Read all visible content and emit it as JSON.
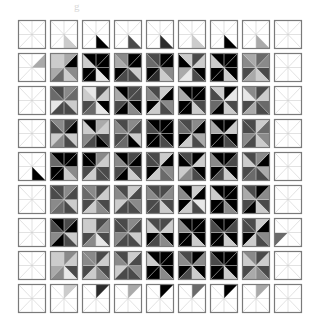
{
  "figure": {
    "type": "glyph-matrix",
    "title_artifact": "g",
    "rows": 9,
    "cols": 9,
    "cell_width_px": 32,
    "cell_height_px": 33,
    "grid_origin_x_px": 16,
    "grid_origin_y_px": 18,
    "background_color": "#ffffff",
    "border_color": "#7a7a7a",
    "guide_line_color": "#cfcfcf",
    "sector_count": 8,
    "sector_description": "Each cell is a square divided into 8 triangular sectors radiating from the center; each sector is filled with a grayscale level encoding a data value.",
    "palette": {
      "level_0": "#ffffff",
      "level_1": "#e8e8e8",
      "level_2": "#cccccc",
      "level_3": "#aaaaaa",
      "level_4": "#8a8a8a",
      "level_5": "#6a6a6a",
      "level_6": "#4a4a4a",
      "level_7": "#2b2b2b",
      "level_8": "#111111",
      "level_9": "#000000"
    }
  },
  "chart_data": {
    "type": "heatmap",
    "title": "",
    "subtitle": "",
    "xlabel": "",
    "ylabel": "",
    "grid": true,
    "legend": "none",
    "xticklabels": [
      "1",
      "2",
      "3",
      "4",
      "5",
      "6",
      "7",
      "8",
      "9"
    ],
    "yticklabels": [
      "1",
      "2",
      "3",
      "4",
      "5",
      "6",
      "7",
      "8",
      "9"
    ],
    "encoding": "Each matrix entry is drawn as an 8-sector pinwheel glyph; sector grayscale level (0 = white, 9 = black) is the datum.",
    "values": [
      [
        [
          0,
          0,
          0,
          0,
          0,
          0,
          0,
          0
        ],
        [
          0,
          0,
          0,
          0,
          2,
          0,
          0,
          0
        ],
        [
          0,
          0,
          0,
          0,
          9,
          0,
          0,
          0
        ],
        [
          0,
          0,
          0,
          0,
          6,
          0,
          0,
          0
        ],
        [
          0,
          0,
          0,
          0,
          7,
          0,
          0,
          0
        ],
        [
          0,
          0,
          0,
          0,
          2,
          0,
          0,
          0
        ],
        [
          0,
          0,
          0,
          0,
          9,
          0,
          0,
          0
        ],
        [
          0,
          0,
          0,
          0,
          3,
          0,
          0,
          0
        ],
        [
          0,
          0,
          0,
          0,
          0,
          0,
          0,
          0
        ]
      ],
      [
        [
          0,
          0,
          3,
          0,
          0,
          0,
          0,
          0
        ],
        [
          2,
          3,
          9,
          4,
          2,
          5,
          3,
          2
        ],
        [
          9,
          9,
          9,
          9,
          1,
          9,
          9,
          2
        ],
        [
          4,
          9,
          9,
          2,
          6,
          6,
          9,
          3
        ],
        [
          6,
          9,
          9,
          4,
          2,
          7,
          9,
          5
        ],
        [
          2,
          6,
          2,
          9,
          6,
          1,
          3,
          9
        ],
        [
          9,
          9,
          9,
          9,
          2,
          9,
          9,
          2
        ],
        [
          3,
          5,
          4,
          6,
          2,
          3,
          6,
          4
        ],
        [
          0,
          0,
          0,
          0,
          0,
          0,
          0,
          0
        ]
      ],
      [
        [
          0,
          0,
          0,
          0,
          0,
          0,
          0,
          0
        ],
        [
          6,
          4,
          5,
          2,
          6,
          6,
          1,
          5
        ],
        [
          1,
          6,
          2,
          9,
          1,
          5,
          6,
          2
        ],
        [
          9,
          6,
          6,
          9,
          4,
          9,
          6,
          3
        ],
        [
          6,
          2,
          9,
          4,
          6,
          2,
          9,
          4
        ],
        [
          9,
          9,
          9,
          6,
          2,
          9,
          9,
          3
        ],
        [
          2,
          9,
          1,
          6,
          2,
          9,
          5,
          6
        ],
        [
          4,
          6,
          2,
          5,
          6,
          3,
          6,
          1
        ],
        [
          0,
          0,
          0,
          0,
          0,
          0,
          0,
          0
        ]
      ],
      [
        [
          0,
          0,
          0,
          0,
          0,
          0,
          0,
          0
        ],
        [
          4,
          6,
          9,
          2,
          6,
          4,
          2,
          6
        ],
        [
          9,
          3,
          2,
          6,
          9,
          6,
          4,
          2
        ],
        [
          6,
          4,
          6,
          2,
          9,
          5,
          6,
          4
        ],
        [
          9,
          9,
          9,
          9,
          6,
          9,
          9,
          6
        ],
        [
          6,
          4,
          9,
          3,
          6,
          2,
          9,
          5
        ],
        [
          9,
          9,
          2,
          9,
          6,
          9,
          9,
          3
        ],
        [
          6,
          2,
          5,
          4,
          2,
          6,
          4,
          6
        ],
        [
          0,
          0,
          0,
          0,
          0,
          0,
          0,
          0
        ]
      ],
      [
        [
          0,
          0,
          0,
          0,
          9,
          0,
          0,
          0
        ],
        [
          9,
          9,
          9,
          4,
          2,
          9,
          9,
          5
        ],
        [
          9,
          4,
          2,
          6,
          6,
          2,
          6,
          9
        ],
        [
          9,
          6,
          9,
          6,
          2,
          9,
          6,
          4
        ],
        [
          6,
          2,
          9,
          4,
          5,
          2,
          9,
          6
        ],
        [
          6,
          9,
          2,
          9,
          6,
          4,
          2,
          9
        ],
        [
          9,
          9,
          6,
          9,
          2,
          6,
          9,
          4
        ],
        [
          6,
          4,
          9,
          3,
          6,
          5,
          6,
          2
        ],
        [
          0,
          0,
          0,
          0,
          0,
          0,
          0,
          0
        ]
      ],
      [
        [
          0,
          0,
          0,
          0,
          0,
          0,
          0,
          0
        ],
        [
          6,
          4,
          6,
          2,
          6,
          5,
          4,
          6
        ],
        [
          4,
          6,
          2,
          6,
          4,
          2,
          6,
          5
        ],
        [
          6,
          2,
          6,
          4,
          6,
          6,
          2,
          4
        ],
        [
          6,
          6,
          4,
          6,
          2,
          6,
          6,
          4
        ],
        [
          9,
          2,
          9,
          1,
          6,
          2,
          9,
          4
        ],
        [
          9,
          9,
          9,
          9,
          4,
          9,
          9,
          2
        ],
        [
          6,
          9,
          4,
          6,
          2,
          9,
          6,
          3
        ],
        [
          0,
          0,
          0,
          0,
          0,
          0,
          0,
          0
        ]
      ],
      [
        [
          0,
          0,
          0,
          0,
          0,
          0,
          0,
          0
        ],
        [
          9,
          6,
          9,
          2,
          6,
          9,
          4,
          6
        ],
        [
          2,
          6,
          4,
          6,
          1,
          4,
          6,
          2
        ],
        [
          6,
          4,
          6,
          2,
          6,
          6,
          4,
          6
        ],
        [
          6,
          6,
          2,
          9,
          4,
          6,
          9,
          2
        ],
        [
          9,
          9,
          9,
          9,
          2,
          9,
          9,
          4
        ],
        [
          9,
          9,
          6,
          9,
          2,
          9,
          9,
          6
        ],
        [
          6,
          2,
          9,
          4,
          6,
          2,
          9,
          6
        ],
        [
          0,
          0,
          0,
          0,
          0,
          0,
          5
        ]
      ],
      [
        [
          0,
          0,
          0,
          0,
          0,
          0,
          0,
          0
        ],
        [
          2,
          4,
          2,
          6,
          1,
          4,
          3,
          2
        ],
        [
          4,
          6,
          2,
          6,
          4,
          2,
          6,
          4
        ],
        [
          6,
          2,
          6,
          4,
          6,
          6,
          2,
          4
        ],
        [
          9,
          9,
          9,
          9,
          4,
          9,
          9,
          2
        ],
        [
          6,
          9,
          4,
          9,
          2,
          6,
          9,
          4
        ],
        [
          9,
          9,
          9,
          9,
          2,
          9,
          9,
          6
        ],
        [
          4,
          6,
          2,
          6,
          4,
          3,
          6,
          2
        ],
        [
          0,
          0,
          0,
          0,
          0,
          0,
          0,
          0
        ]
      ],
      [
        [
          0,
          0,
          0,
          0,
          0,
          0,
          0,
          0
        ],
        [
          0,
          2,
          0,
          0,
          0,
          0,
          0,
          0
        ],
        [
          0,
          7,
          0,
          0,
          0,
          0,
          0,
          0
        ],
        [
          0,
          3,
          0,
          0,
          0,
          0,
          0,
          0
        ],
        [
          0,
          9,
          0,
          0,
          0,
          0,
          0,
          0
        ],
        [
          0,
          5,
          0,
          0,
          0,
          0,
          0,
          0
        ],
        [
          0,
          9,
          0,
          0,
          0,
          0,
          0,
          0
        ],
        [
          0,
          3,
          0,
          0,
          0,
          0,
          0,
          0
        ],
        [
          0,
          0,
          0,
          0,
          0,
          0,
          0,
          0
        ]
      ]
    ]
  }
}
